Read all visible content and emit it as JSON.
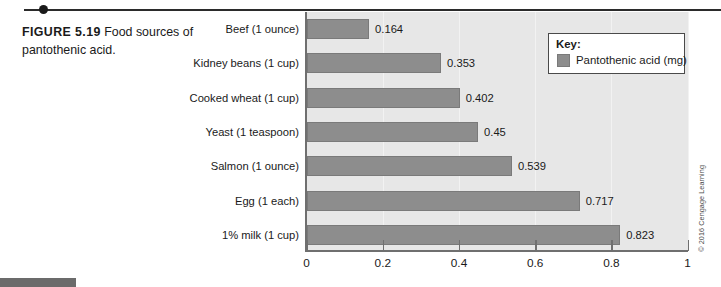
{
  "caption": {
    "figure_label": "FIGURE 5.19",
    "text": "Food sources of pantothenic acid."
  },
  "legend": {
    "title": "Key:",
    "series_label": "Pantothenic acid (mg)"
  },
  "copyright": "© 2016 Cengage Learning",
  "colors": {
    "bar_fill": "#8d8d8d",
    "bar_stroke": "#7a7a7a",
    "plot_background": "#e7e7e7",
    "axis": "#6f6f6f",
    "text": "#1a1a1a"
  },
  "chart_data": {
    "type": "bar",
    "orientation": "horizontal",
    "title": "",
    "xlabel": "",
    "ylabel": "",
    "categories": [
      "Beef (1 ounce)",
      "Kidney beans (1 cup)",
      "Cooked wheat (1 cup)",
      "Yeast (1 teaspoon)",
      "Salmon (1 ounce)",
      "Egg (1 each)",
      "1% milk (1 cup)"
    ],
    "series": [
      {
        "name": "Pantothenic acid (mg)",
        "values": [
          0.164,
          0.353,
          0.402,
          0.45,
          0.539,
          0.717,
          0.823
        ]
      }
    ],
    "value_labels": [
      "0.164",
      "0.353",
      "0.402",
      "0.45",
      "0.539",
      "0.717",
      "0.823"
    ],
    "xlim": [
      0,
      1
    ],
    "xticks": [
      0,
      0.2,
      0.4,
      0.6,
      0.8,
      1
    ],
    "xtick_labels": [
      "0",
      "0.2",
      "0.4",
      "0.6",
      "0.8",
      "1"
    ],
    "grid": true,
    "legend_position": "top-right"
  }
}
